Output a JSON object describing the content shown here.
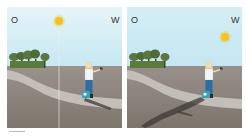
{
  "panels": [
    {
      "id": "morning",
      "label_left": "O",
      "label_right": "W",
      "sun_position": "top-center",
      "shadow_direction": "right"
    },
    {
      "id": "evening",
      "label_left": "O",
      "label_right": "W",
      "sun_position": "top-right",
      "shadow_direction": "left"
    }
  ],
  "colors": {
    "sky_top": "#d8eef4",
    "sky_bottom": "#c9e9f3",
    "ground": "#8f8780",
    "path": "#c8c4bf",
    "sun": "#f6c21c",
    "tree": "#4f6b36",
    "shadow": "#3e3935",
    "jeans": "#2e6da4",
    "bag": "#3f9fb3"
  }
}
